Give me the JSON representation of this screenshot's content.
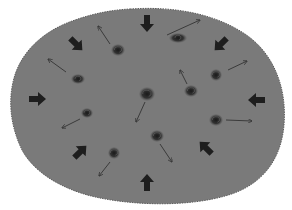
{
  "diagram": {
    "title": "",
    "background_color": "#ffffff",
    "blob": {
      "fill": "#7a7a7a",
      "edge": "#5c5c5c",
      "path": "M 130 9 C 175 6 215 14 245 34 C 275 54 287 90 284 125 C 281 160 262 186 225 196 C 190 206 140 206 100 198 C 65 191 35 174 22 150 C 10 125 8 100 14 78 C 22 50 45 30 75 20 C 95 13 112 10 130 9 Z"
    },
    "galaxy_color": "#2e2e2e",
    "galaxies": [
      {
        "x": 118,
        "y": 50,
        "rx": 7,
        "ry": 6
      },
      {
        "x": 178,
        "y": 38,
        "rx": 9,
        "ry": 5
      },
      {
        "x": 78,
        "y": 79,
        "rx": 7,
        "ry": 5
      },
      {
        "x": 216,
        "y": 75,
        "rx": 6,
        "ry": 6
      },
      {
        "x": 147,
        "y": 94,
        "rx": 8,
        "ry": 7
      },
      {
        "x": 191,
        "y": 91,
        "rx": 7,
        "ry": 6
      },
      {
        "x": 87,
        "y": 113,
        "rx": 6,
        "ry": 5
      },
      {
        "x": 216,
        "y": 120,
        "rx": 7,
        "ry": 6
      },
      {
        "x": 157,
        "y": 136,
        "rx": 7,
        "ry": 6
      },
      {
        "x": 114,
        "y": 153,
        "rx": 6,
        "ry": 6
      }
    ],
    "thin_arrow_color": "#333333",
    "thin_arrows": [
      {
        "x1": 110,
        "y1": 44,
        "x2": 98,
        "y2": 26
      },
      {
        "x1": 167,
        "y1": 35,
        "x2": 200,
        "y2": 20
      },
      {
        "x1": 66,
        "y1": 72,
        "x2": 48,
        "y2": 59
      },
      {
        "x1": 228,
        "y1": 70,
        "x2": 247,
        "y2": 61
      },
      {
        "x1": 145,
        "y1": 102,
        "x2": 136,
        "y2": 122
      },
      {
        "x1": 187,
        "y1": 84,
        "x2": 180,
        "y2": 70
      },
      {
        "x1": 80,
        "y1": 119,
        "x2": 62,
        "y2": 128
      },
      {
        "x1": 226,
        "y1": 120,
        "x2": 252,
        "y2": 121
      },
      {
        "x1": 160,
        "y1": 144,
        "x2": 172,
        "y2": 162
      },
      {
        "x1": 110,
        "y1": 162,
        "x2": 99,
        "y2": 176
      }
    ],
    "thick_arrow_color": "#1e1e1e",
    "thick_arrows": [
      {
        "x": 147,
        "y": 23,
        "angle": 90,
        "label": "down"
      },
      {
        "x": 76,
        "y": 44,
        "angle": 45,
        "label": "down-right"
      },
      {
        "x": 221,
        "y": 44,
        "angle": 135,
        "label": "down-left"
      },
      {
        "x": 37,
        "y": 99,
        "angle": 0,
        "label": "right"
      },
      {
        "x": 257,
        "y": 100,
        "angle": 180,
        "label": "left"
      },
      {
        "x": 80,
        "y": 152,
        "angle": -45,
        "label": "up-right"
      },
      {
        "x": 206,
        "y": 148,
        "angle": -135,
        "label": "up-left"
      },
      {
        "x": 147,
        "y": 183,
        "angle": -90,
        "label": "up"
      }
    ]
  }
}
